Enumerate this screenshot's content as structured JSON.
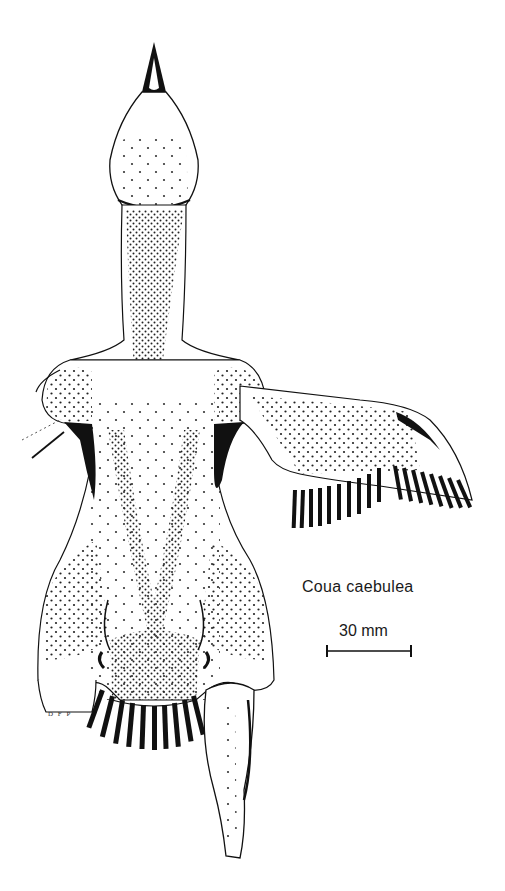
{
  "figure": {
    "species_label": "Coua caebulea",
    "scale": {
      "label": "30 mm",
      "bar_length_px": 84
    },
    "artist_initials": "D F P",
    "colors": {
      "background": "#ffffff",
      "ink": "#111111"
    },
    "parts": [
      "bill",
      "head",
      "neck",
      "shoulders",
      "left-wing-stub",
      "right-wing-extended",
      "body",
      "legs",
      "tail",
      "right-leg-extended"
    ]
  }
}
